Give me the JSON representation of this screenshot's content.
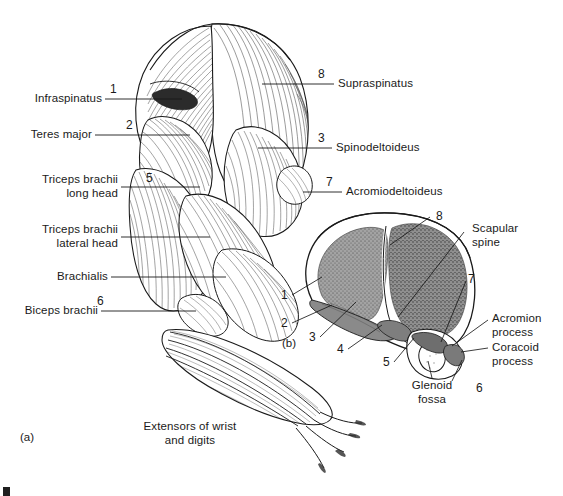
{
  "figure": {
    "type": "anatomical-illustration",
    "background_color": "#ffffff",
    "ink_color": "#1a1a1a",
    "shade_color": "#9a9a9a",
    "panels": [
      {
        "id": "a",
        "tag": "(a)",
        "description": "Lateral view of shoulder and forelimb muscles"
      },
      {
        "id": "b",
        "tag": "(b)",
        "description": "Lateral view of scapula with muscle attachment sites"
      }
    ]
  },
  "panel_a": {
    "tag": "(a)",
    "labels_left": [
      {
        "number": "1",
        "text": "Infraspinatus"
      },
      {
        "number": "2",
        "text": "Teres major"
      },
      {
        "number": "5",
        "text": "Triceps brachii\nlong head"
      },
      {
        "number": "",
        "text": "Triceps brachii\nlateral head"
      },
      {
        "number": "",
        "text": "Brachialis"
      },
      {
        "number": "6",
        "text": "Biceps brachii"
      }
    ],
    "labels_right": [
      {
        "number": "8",
        "text": "Supraspinatus"
      },
      {
        "number": "3",
        "text": "Spinodeltoideus"
      },
      {
        "number": "7",
        "text": "Acromiodeltoideus"
      }
    ],
    "labels_bottom": [
      {
        "number": "",
        "text": "Extensors of wrist\nand digits"
      }
    ]
  },
  "panel_b": {
    "tag": "(b)",
    "numbered_leaders": [
      "1",
      "2",
      "3",
      "4",
      "5",
      "6",
      "7",
      "8"
    ],
    "labels": [
      {
        "text": "Scapular\nspine"
      },
      {
        "text": "Acromion\nprocess"
      },
      {
        "text": "Coracoid\nprocess"
      },
      {
        "text": "Glenoid\nfossa"
      }
    ]
  }
}
